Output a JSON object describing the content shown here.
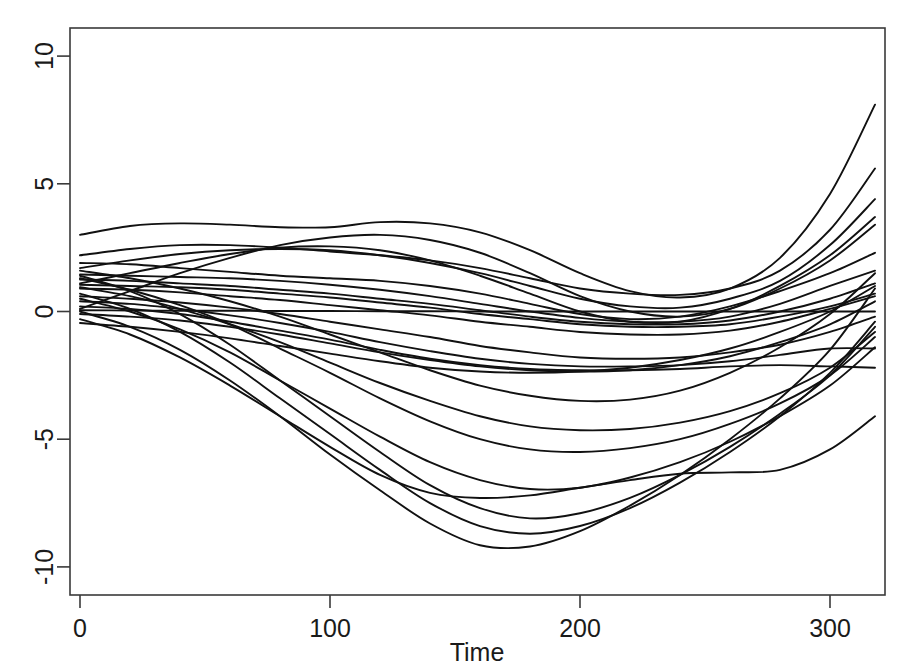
{
  "chart_data": {
    "type": "line",
    "title": "",
    "xlabel": "Time",
    "ylabel": "",
    "xlim": [
      -4,
      322
    ],
    "ylim": [
      -11.1,
      11.1
    ],
    "xticks": [
      0,
      100,
      200,
      300
    ],
    "xtick_labels": [
      "0",
      "100",
      "200",
      "300"
    ],
    "yticks": [
      -10,
      -5,
      0,
      5,
      10
    ],
    "ytick_labels": [
      "-10",
      "-5",
      "0",
      "5",
      "10"
    ],
    "grid": false,
    "legend": null,
    "legend_position": "none",
    "line_color": "#111111",
    "background_color": "#ffffff",
    "frame_color": "#3a3a3a",
    "n_series": 24,
    "x": [
      0,
      20,
      40,
      60,
      80,
      100,
      120,
      140,
      160,
      180,
      200,
      220,
      240,
      260,
      280,
      300,
      318
    ],
    "series": [
      {
        "name": "curve-01",
        "values": [
          3.0,
          3.35,
          3.45,
          3.4,
          3.3,
          3.3,
          3.5,
          3.45,
          3.1,
          2.4,
          1.5,
          0.8,
          0.55,
          0.9,
          2.1,
          4.6,
          8.1
        ]
      },
      {
        "name": "curve-02",
        "values": [
          2.2,
          2.45,
          2.6,
          2.6,
          2.5,
          2.35,
          2.2,
          2.0,
          1.7,
          1.3,
          0.9,
          0.7,
          0.65,
          0.9,
          1.6,
          3.2,
          5.6
        ]
      },
      {
        "name": "curve-03",
        "values": [
          1.7,
          2.0,
          2.25,
          2.4,
          2.45,
          2.4,
          2.2,
          1.9,
          1.5,
          1.0,
          0.5,
          0.2,
          0.15,
          0.5,
          1.2,
          2.6,
          4.4
        ]
      },
      {
        "name": "curve-04",
        "values": [
          1.1,
          1.5,
          1.9,
          2.25,
          2.5,
          2.55,
          2.4,
          2.0,
          1.4,
          0.7,
          0.0,
          -0.4,
          -0.4,
          0.1,
          1.0,
          2.2,
          3.7
        ]
      },
      {
        "name": "curve-05",
        "values": [
          0.1,
          0.8,
          1.5,
          2.1,
          2.6,
          2.9,
          3.0,
          2.8,
          2.3,
          1.5,
          0.6,
          0.0,
          -0.2,
          0.1,
          0.9,
          2.0,
          3.4
        ]
      },
      {
        "name": "curve-06",
        "values": [
          1.9,
          1.85,
          1.7,
          1.55,
          1.4,
          1.3,
          1.2,
          1.0,
          0.7,
          0.3,
          -0.1,
          -0.3,
          -0.2,
          0.2,
          0.8,
          1.5,
          2.3
        ]
      },
      {
        "name": "curve-07",
        "values": [
          1.45,
          1.4,
          1.35,
          1.3,
          1.2,
          1.05,
          0.85,
          0.6,
          0.3,
          0.0,
          -0.25,
          -0.4,
          -0.4,
          -0.2,
          0.3,
          1.0,
          1.6
        ]
      },
      {
        "name": "curve-08",
        "values": [
          1.25,
          1.2,
          1.1,
          1.0,
          0.85,
          0.7,
          0.5,
          0.3,
          0.05,
          -0.2,
          -0.4,
          -0.5,
          -0.5,
          -0.35,
          0.0,
          0.5,
          1.1
        ]
      },
      {
        "name": "curve-09",
        "values": [
          1.05,
          1.0,
          0.95,
          0.85,
          0.7,
          0.55,
          0.35,
          0.15,
          -0.1,
          -0.3,
          -0.5,
          -0.6,
          -0.6,
          -0.5,
          -0.2,
          0.2,
          0.7
        ]
      },
      {
        "name": "curve-10",
        "values": [
          0.9,
          0.85,
          0.75,
          0.6,
          0.45,
          0.25,
          0.05,
          -0.15,
          -0.4,
          -0.6,
          -0.8,
          -0.9,
          -0.9,
          -0.75,
          -0.4,
          0.1,
          0.6
        ]
      },
      {
        "name": "curve-11",
        "values": [
          0.05,
          0.04,
          0.03,
          0.03,
          0.02,
          0.02,
          0.01,
          0.01,
          0.0,
          0.0,
          0.0,
          0.0,
          0.0,
          0.0,
          0.0,
          0.0,
          0.0
        ]
      },
      {
        "name": "curve-12",
        "values": [
          0.6,
          0.5,
          0.35,
          0.15,
          -0.1,
          -0.4,
          -0.7,
          -1.0,
          -1.35,
          -1.6,
          -1.8,
          -1.85,
          -1.8,
          -1.6,
          -1.3,
          -0.8,
          -0.2
        ]
      },
      {
        "name": "curve-13",
        "values": [
          0.4,
          0.3,
          0.1,
          -0.15,
          -0.45,
          -0.8,
          -1.2,
          -1.55,
          -1.85,
          -2.05,
          -2.15,
          -2.15,
          -2.1,
          -1.95,
          -1.7,
          -1.45,
          -1.45
        ]
      },
      {
        "name": "curve-14",
        "values": [
          0.2,
          0.1,
          -0.1,
          -0.4,
          -0.75,
          -1.1,
          -1.5,
          -1.85,
          -2.1,
          -2.25,
          -2.3,
          -2.3,
          -2.25,
          -2.15,
          -2.1,
          -2.15,
          -2.2
        ]
      },
      {
        "name": "curve-15",
        "values": [
          -0.1,
          -0.2,
          -0.35,
          -0.6,
          -0.9,
          -1.25,
          -1.6,
          -1.9,
          -2.15,
          -2.3,
          -2.35,
          -2.3,
          -2.1,
          -1.75,
          -1.2,
          -0.5,
          0.4
        ]
      },
      {
        "name": "curve-16",
        "values": [
          -0.45,
          -0.6,
          -0.8,
          -1.05,
          -1.35,
          -1.65,
          -1.95,
          -2.2,
          -2.35,
          -2.4,
          -2.35,
          -2.2,
          -1.9,
          -1.45,
          -0.8,
          0.0,
          1.0
        ]
      },
      {
        "name": "curve-17",
        "values": [
          1.6,
          1.3,
          0.9,
          0.4,
          -0.2,
          -0.9,
          -1.6,
          -2.3,
          -2.9,
          -3.3,
          -3.5,
          -3.45,
          -3.1,
          -2.4,
          -1.4,
          -0.1,
          1.5
        ]
      },
      {
        "name": "curve-18",
        "values": [
          0.95,
          0.6,
          0.1,
          -0.5,
          -1.2,
          -2.0,
          -2.8,
          -3.5,
          -4.1,
          -4.5,
          -4.65,
          -4.6,
          -4.35,
          -3.9,
          -3.2,
          -2.2,
          -0.8
        ]
      },
      {
        "name": "curve-19",
        "values": [
          1.3,
          0.85,
          0.25,
          -0.5,
          -1.45,
          -2.4,
          -3.4,
          -4.3,
          -5.0,
          -5.4,
          -5.5,
          -5.35,
          -5.0,
          -4.4,
          -3.6,
          -2.5,
          -1.0
        ]
      },
      {
        "name": "curve-20",
        "values": [
          0.5,
          0.0,
          -0.7,
          -1.6,
          -2.7,
          -3.8,
          -4.9,
          -5.9,
          -6.6,
          -6.95,
          -6.9,
          -6.5,
          -5.9,
          -5.1,
          -4.1,
          -2.9,
          -1.4
        ]
      },
      {
        "name": "curve-21",
        "values": [
          1.4,
          0.8,
          -0.1,
          -1.3,
          -2.7,
          -4.1,
          -5.5,
          -6.8,
          -7.7,
          -8.1,
          -7.9,
          -7.3,
          -6.4,
          -5.3,
          -4.0,
          -2.5,
          -0.6
        ]
      },
      {
        "name": "curve-22",
        "values": [
          0.7,
          0.1,
          -0.8,
          -2.0,
          -3.4,
          -4.8,
          -6.2,
          -7.5,
          -8.4,
          -8.7,
          -8.4,
          -7.7,
          -6.7,
          -5.5,
          -4.1,
          -2.4,
          -0.4
        ]
      },
      {
        "name": "curve-23",
        "values": [
          0.0,
          -0.6,
          -1.5,
          -2.7,
          -4.1,
          -5.6,
          -7.0,
          -8.3,
          -9.15,
          -9.2,
          -8.6,
          -7.6,
          -6.4,
          -5.0,
          -3.4,
          -1.5,
          0.9
        ]
      },
      {
        "name": "curve-24",
        "values": [
          -0.3,
          -0.9,
          -1.8,
          -2.9,
          -4.1,
          -5.3,
          -6.4,
          -7.1,
          -7.3,
          -7.2,
          -6.9,
          -6.6,
          -6.35,
          -6.3,
          -6.2,
          -5.4,
          -4.1
        ]
      }
    ]
  },
  "axes": {
    "x_title": "Time",
    "y_title": ""
  }
}
